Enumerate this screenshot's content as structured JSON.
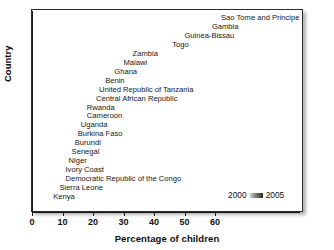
{
  "chart_data": {
    "type": "bar",
    "subtype": "horizontal-range",
    "title": "",
    "xlabel": "Percentage of children",
    "ylabel": "Country",
    "xlim": [
      0,
      70
    ],
    "xticks": [
      0,
      10,
      20,
      30,
      40,
      50,
      60
    ],
    "xtick_labels": [
      "0",
      "10",
      "20",
      "30",
      "40",
      "50",
      "60"
    ],
    "grid": false,
    "legend_position": "inside-bottom-right",
    "legend": [
      {
        "label": "2000",
        "color": "#1d1d1d"
      },
      {
        "label": "2005",
        "color": "#cfcfcf"
      }
    ],
    "series": [
      {
        "name": "2000",
        "color": "#1d1d1d"
      },
      {
        "name": "2005",
        "color": "#cfcfcf"
      }
    ],
    "categories": [
      "Sao Tome and Principe",
      "Gambia",
      "Guinea-Bissau",
      "Togo",
      "Zambia",
      "Malawi",
      "Ghana",
      "Benin",
      "United Republic of Tanzania",
      "Central African Republic",
      "Rwanda",
      "Cameroon",
      "Uganda",
      "Burkina Faso",
      "Burundi",
      "Senegal",
      "Niger",
      "Ivory Coast",
      "Democratic Republic of the Congo",
      "Sierra Leone",
      "Kenya"
    ],
    "bars": [
      {
        "country": "Sao Tome and Principe",
        "start": 28,
        "end": 61,
        "label": "Sao Tome and Principe"
      },
      {
        "country": "Gambia",
        "start": 24,
        "end": 58,
        "label": "Gambia"
      },
      {
        "country": "Guinea-Bissau",
        "start": 17,
        "end": 49,
        "label": "Guinea-Bissau"
      },
      {
        "country": "Togo",
        "start": 9,
        "end": 45,
        "label": "Togo"
      },
      {
        "country": "Zambia",
        "start": 1,
        "end": 32,
        "label": "Zambia"
      },
      {
        "country": "Malawi",
        "start": 2,
        "end": 29,
        "label": "Malawi"
      },
      {
        "country": "Ghana",
        "start": 3,
        "end": 26,
        "label": "Ghana"
      },
      {
        "country": "Benin",
        "start": 6,
        "end": 23,
        "label": "Benin"
      },
      {
        "country": "United Republic of Tanzania",
        "start": 1,
        "end": 21,
        "label": "United Republic of Tanzania"
      },
      {
        "country": "Central African Republic",
        "start": 1,
        "end": 20,
        "label": "Central African Republic"
      },
      {
        "country": "Rwanda",
        "start": 3,
        "end": 17,
        "label": "Rwanda"
      },
      {
        "country": "Cameroon",
        "start": 1,
        "end": 17,
        "label": "Cameroon"
      },
      {
        "country": "Uganda",
        "start": 2,
        "end": 15,
        "label": "Uganda"
      },
      {
        "country": "Burkina Faso",
        "start": 3,
        "end": 14,
        "label": "Burkina Faso"
      },
      {
        "country": "Burundi",
        "start": 1,
        "end": 13,
        "label": "Burundi"
      },
      {
        "country": "Senegal",
        "start": 2,
        "end": 12,
        "label": "Senegal"
      },
      {
        "country": "Niger",
        "start": 1,
        "end": 11,
        "label": "Niger"
      },
      {
        "country": "Ivory Coast",
        "start": 1,
        "end": 10,
        "label": "Ivory Coast"
      },
      {
        "country": "Democratic Republic of the Congo",
        "start": 1,
        "end": 10,
        "label": "Democratic Republic of the Congo"
      },
      {
        "country": "Sierra Leone",
        "start": 2,
        "end": 8,
        "label": "Sierra Leone"
      },
      {
        "country": "Kenya",
        "start": 3,
        "end": 6,
        "label": "Kenya"
      }
    ]
  },
  "axes": {
    "x_title": "Percentage of children",
    "y_title": "Country"
  },
  "legend": {
    "left_label": "2000",
    "right_label": "2005",
    "swatch": "gradient-swatch-icon"
  }
}
